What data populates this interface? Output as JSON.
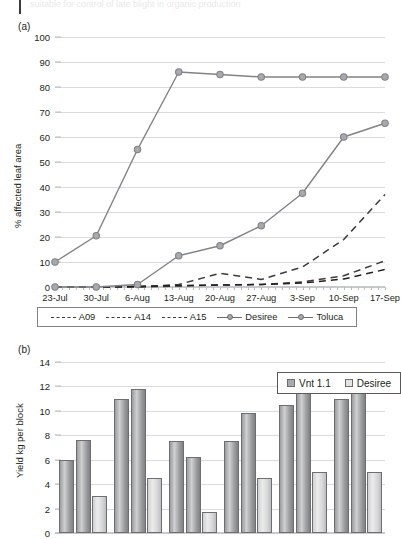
{
  "page": {
    "top_partial_text": "suitable for control of late blight in organic production",
    "panel_a_label": "(a)",
    "panel_b_label": "(b)"
  },
  "chart_data": [
    {
      "type": "line",
      "panel": "(a)",
      "title": "",
      "xlabel": "",
      "ylabel": "% affected leaf area",
      "ylim": [
        0,
        100
      ],
      "ytick_step": 10,
      "yticks": [
        "0",
        "10",
        "20",
        "30",
        "40",
        "50",
        "60",
        "70",
        "80",
        "90",
        "100"
      ],
      "grid": true,
      "legend_position": "bottom",
      "categories": [
        "23-Jul",
        "30-Jul",
        "6-Aug",
        "13-Aug",
        "20-Aug",
        "27-Aug",
        "3-Sep",
        "10-Sep",
        "17-Sep"
      ],
      "series": [
        {
          "name": "A09",
          "style": "dashed",
          "marker": "none",
          "color": "#3c3c3c",
          "values": [
            0,
            0,
            0,
            1.0,
            5.5,
            3.0,
            8.0,
            19.0,
            37.0
          ]
        },
        {
          "name": "A14",
          "style": "dashed",
          "marker": "none",
          "color": "#3c3c3c",
          "values": [
            0,
            0,
            0,
            0.4,
            0.8,
            1.0,
            2.0,
            4.5,
            10.5
          ]
        },
        {
          "name": "A15",
          "style": "dashed",
          "marker": "none",
          "color": "#231f20",
          "values": [
            0,
            0,
            0.3,
            0.6,
            0.8,
            1.0,
            1.6,
            3.2,
            7.0
          ]
        },
        {
          "name": "Desiree",
          "style": "solid",
          "marker": "circle",
          "color": "#808285",
          "values": [
            10.0,
            20.5,
            55.0,
            86.0,
            85.0,
            84.0,
            84.0,
            84.0,
            84.0
          ]
        },
        {
          "name": "Toluca",
          "style": "solid",
          "marker": "circle",
          "color": "#808285",
          "values": [
            0,
            0,
            1.0,
            12.5,
            16.5,
            24.5,
            37.5,
            60.0,
            65.5
          ]
        }
      ],
      "legend": [
        "A09",
        "A14",
        "A15",
        "Desiree",
        "Toluca"
      ]
    },
    {
      "type": "bar",
      "panel": "(b)",
      "title": "",
      "xlabel": "",
      "ylabel": "Yield kg per block",
      "ylim": [
        0,
        14
      ],
      "ytick_step": 2,
      "yticks": [
        "0",
        "2",
        "4",
        "6",
        "8",
        "10",
        "12",
        "14"
      ],
      "grid": true,
      "legend_position": "top-right",
      "legend": [
        "Vnt 1.1",
        "Desiree"
      ],
      "groups": [
        {
          "bars": [
            6.0,
            7.6,
            3.0
          ]
        },
        {
          "bars": [
            11.0,
            11.8,
            4.5
          ]
        },
        {
          "bars": [
            7.5,
            6.2,
            1.7
          ]
        },
        {
          "bars": [
            7.5,
            9.8,
            4.5
          ]
        },
        {
          "bars": [
            10.5,
            12.0,
            5.0
          ]
        },
        {
          "bars": [
            11.0,
            13.0,
            5.0
          ]
        }
      ],
      "bar_series_map": [
        "Vnt 1.1",
        "Vnt 1.1",
        "Desiree"
      ]
    }
  ],
  "colors": {
    "grid": "#d9dadb",
    "line_gray": "#808285",
    "line_dark": "#3c3c3c",
    "marker_fill": "#a7a9ac",
    "bar_vnt": "#a8a9ab",
    "bar_desiree": "#e3e4e5",
    "text": "#231f20"
  }
}
